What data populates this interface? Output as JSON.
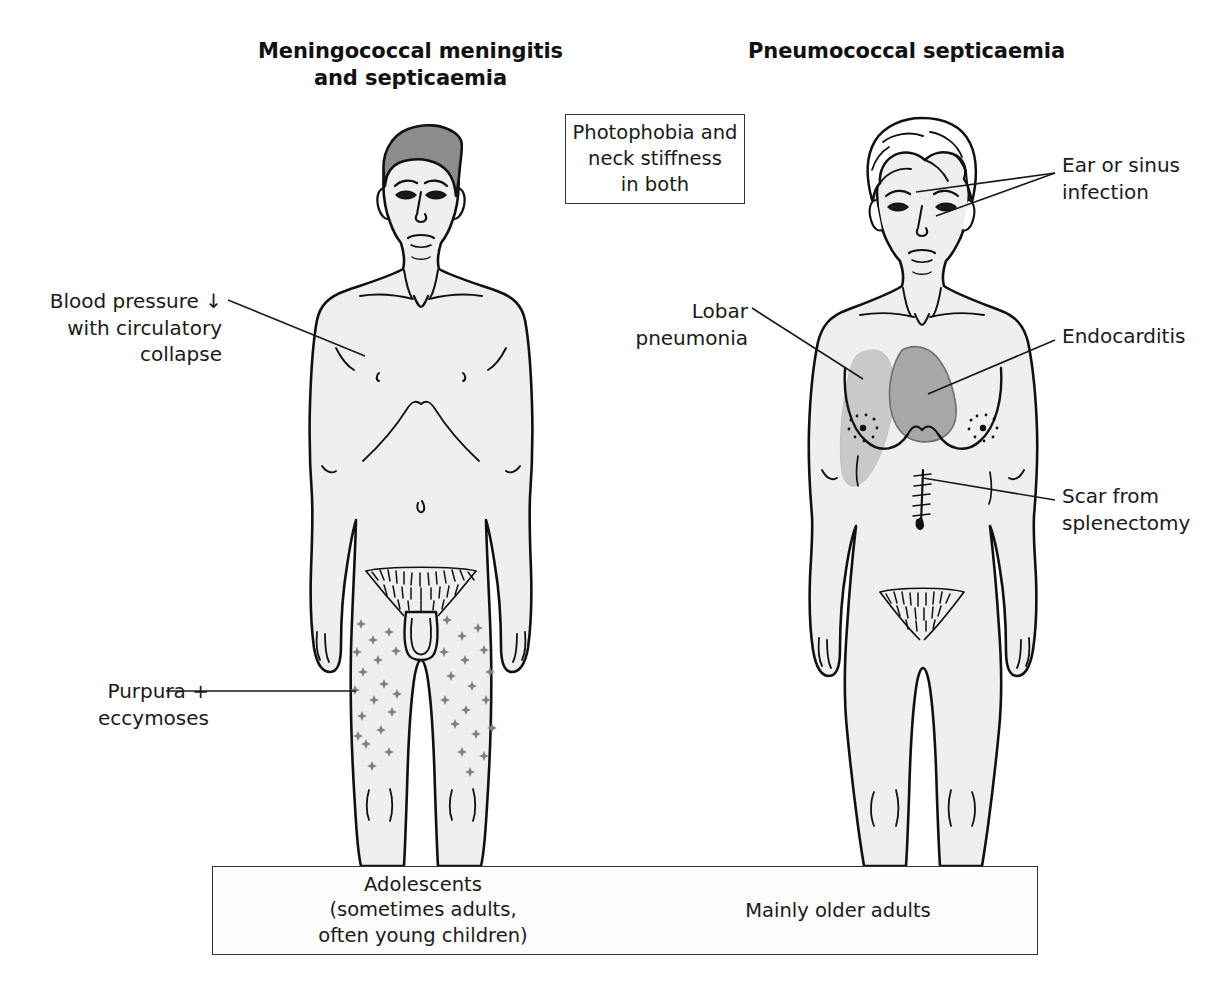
{
  "diagram": {
    "kind": "clinical-comparison-diagram",
    "columns": [
      {
        "id": "left",
        "title_line1": "Meningococcal meningitis",
        "title_line2": "and septicaemia",
        "figure": "adolescent-male-front-view",
        "age_group_lines": [
          "Adolescents",
          "(sometimes adults,",
          "often young children)"
        ]
      },
      {
        "id": "right",
        "title_line1": "Pneumococcal septicaemia",
        "title_line2": "",
        "figure": "older-female-front-view",
        "age_group_lines": [
          "Mainly older adults"
        ]
      }
    ]
  },
  "shared_box": {
    "line1": "Photophobia and",
    "line2": "neck stiffness",
    "line3": "in both"
  },
  "labels": {
    "blood_pressure": {
      "line1": "Blood pressure ↓",
      "line2": "with circulatory",
      "line3": "collapse"
    },
    "purpura": {
      "line1": "Purpura +",
      "line2": "eccymoses"
    },
    "lobar_pneumonia": {
      "line1": "Lobar",
      "line2": "pneumonia"
    },
    "ear_sinus": {
      "line1": "Ear or sinus",
      "line2": "infection"
    },
    "endocarditis": {
      "line1": "Endocarditis",
      "line2": ""
    },
    "scar_splenectomy": {
      "line1": "Scar from",
      "line2": "splenectomy"
    }
  },
  "age_boxes": {
    "left_line1": "Adolescents",
    "left_line2": "(sometimes adults,",
    "left_line3": "often young children)",
    "right_line1": "Mainly older adults"
  },
  "colors": {
    "outline": "#111111",
    "skin_fill": "#efefef",
    "hair_male": "#8c8c8c",
    "hair_female": "#ffffff",
    "lung_shade": "#c9c9c9",
    "heart_shade": "#a8a8a8",
    "purpura": "#808080",
    "box_border": "#333333",
    "page_background": "#ffffff",
    "text": "#1a1a1a"
  }
}
